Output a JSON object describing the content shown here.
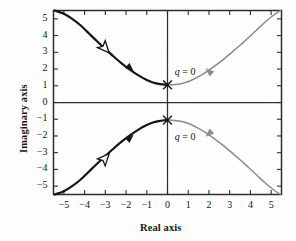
{
  "figure": {
    "kind": "root-locus-plot",
    "background_color": "#ffffff",
    "frame_color": "#2b2b2b",
    "primary_branch_color": "#111111",
    "secondary_branch_color": "#8a8a8a",
    "marker_color": "#111111"
  },
  "chart_data": {
    "type": "line",
    "title": "",
    "xlabel": "Real axis",
    "ylabel": "Imaginary axis",
    "xlim": [
      -5.5,
      5.5
    ],
    "ylim": [
      -5.5,
      5.5
    ],
    "grid": false,
    "legend": null,
    "xticks": [
      -5,
      -4,
      -3,
      -2,
      -1,
      0,
      1,
      2,
      3,
      4,
      5
    ],
    "xtick_labels": [
      "−5",
      "−4",
      "−3",
      "−2",
      "−1",
      "0",
      "1",
      "2",
      "3",
      "4",
      "5"
    ],
    "yticks": [
      -5,
      -4,
      -3,
      -2,
      -1,
      0,
      1,
      2,
      3,
      4,
      5
    ],
    "ytick_labels": [
      "−5",
      "−4",
      "−3",
      "−2",
      "−1",
      "0",
      "1",
      "2",
      "3",
      "4",
      "5"
    ],
    "annotations": [
      {
        "text": "q = 0",
        "x": 0.35,
        "y": 1.75,
        "style": "italic-serif"
      },
      {
        "text": "q = 0",
        "x": 0.35,
        "y": -2.15,
        "style": "italic-serif"
      }
    ],
    "markers": [
      {
        "symbol": "x",
        "label": "open-loop pole",
        "x": 0.0,
        "y": 1.05
      },
      {
        "symbol": "x",
        "label": "open-loop pole",
        "x": 0.0,
        "y": -1.05
      }
    ],
    "series": [
      {
        "name": "upper-left-branch",
        "color": "#111111",
        "width": 2.2,
        "points": [
          [
            0.0,
            1.05
          ],
          [
            -0.35,
            1.1
          ],
          [
            -0.7,
            1.2
          ],
          [
            -1.05,
            1.38
          ],
          [
            -1.4,
            1.62
          ],
          [
            -1.8,
            1.95
          ],
          [
            -2.2,
            2.33
          ],
          [
            -2.6,
            2.75
          ],
          [
            -3.0,
            3.2
          ],
          [
            -3.4,
            3.66
          ],
          [
            -3.8,
            4.14
          ],
          [
            -4.2,
            4.62
          ],
          [
            -4.6,
            5.0
          ],
          [
            -5.0,
            5.3
          ],
          [
            -5.45,
            5.5
          ]
        ]
      },
      {
        "name": "lower-left-branch",
        "color": "#111111",
        "width": 2.2,
        "points": [
          [
            0.0,
            -1.05
          ],
          [
            -0.35,
            -1.1
          ],
          [
            -0.7,
            -1.2
          ],
          [
            -1.05,
            -1.38
          ],
          [
            -1.4,
            -1.62
          ],
          [
            -1.8,
            -1.95
          ],
          [
            -2.2,
            -2.33
          ],
          [
            -2.6,
            -2.75
          ],
          [
            -3.0,
            -3.2
          ],
          [
            -3.4,
            -3.66
          ],
          [
            -3.8,
            -4.14
          ],
          [
            -4.2,
            -4.62
          ],
          [
            -4.6,
            -5.0
          ],
          [
            -5.0,
            -5.3
          ],
          [
            -5.45,
            -5.5
          ]
        ]
      },
      {
        "name": "upper-right-branch",
        "color": "#8a8a8a",
        "width": 1.5,
        "points": [
          [
            0.0,
            1.05
          ],
          [
            0.35,
            1.07
          ],
          [
            0.7,
            1.14
          ],
          [
            1.1,
            1.3
          ],
          [
            1.5,
            1.55
          ],
          [
            1.9,
            1.85
          ],
          [
            2.3,
            2.2
          ],
          [
            2.7,
            2.58
          ],
          [
            3.1,
            3.0
          ],
          [
            3.5,
            3.42
          ],
          [
            3.9,
            3.87
          ],
          [
            4.3,
            4.33
          ],
          [
            4.7,
            4.8
          ],
          [
            5.1,
            5.2
          ],
          [
            5.45,
            5.5
          ]
        ]
      },
      {
        "name": "lower-right-branch",
        "color": "#8a8a8a",
        "width": 1.5,
        "points": [
          [
            0.0,
            -1.05
          ],
          [
            0.35,
            -1.07
          ],
          [
            0.7,
            -1.14
          ],
          [
            1.1,
            -1.3
          ],
          [
            1.5,
            -1.55
          ],
          [
            1.9,
            -1.85
          ],
          [
            2.3,
            -2.2
          ],
          [
            2.7,
            -2.58
          ],
          [
            3.1,
            -3.0
          ],
          [
            3.5,
            -3.42
          ],
          [
            3.9,
            -3.87
          ],
          [
            4.3,
            -4.33
          ],
          [
            4.7,
            -4.8
          ],
          [
            5.1,
            -5.2
          ],
          [
            5.45,
            -5.5
          ]
        ]
      }
    ],
    "direction_arrows": [
      {
        "kind": "hollow",
        "x": -2.95,
        "y": 3.15,
        "angle_deg": 228,
        "color": "#111111"
      },
      {
        "kind": "hollow",
        "x": -2.95,
        "y": -3.25,
        "angle_deg": 132,
        "color": "#111111"
      },
      {
        "kind": "solid",
        "x": -1.75,
        "y": 2.0,
        "angle_deg": 222,
        "color": "#111111"
      },
      {
        "kind": "solid",
        "x": -1.75,
        "y": -2.05,
        "angle_deg": 138,
        "color": "#111111"
      },
      {
        "kind": "solid",
        "x": 1.95,
        "y": 1.92,
        "angle_deg": 42,
        "color": "#8a8a8a"
      },
      {
        "kind": "solid",
        "x": 1.95,
        "y": -1.92,
        "angle_deg": 318,
        "color": "#8a8a8a"
      }
    ]
  }
}
